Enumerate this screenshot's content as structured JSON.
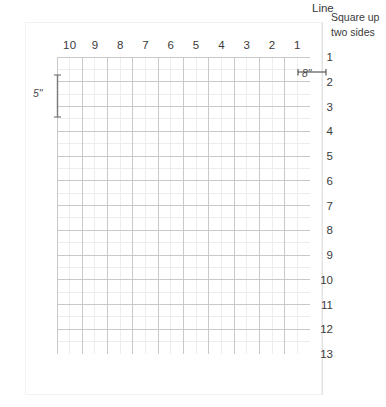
{
  "diagram": {
    "note_lines": [
      "Square up",
      "two sides"
    ],
    "column_headers": [
      "10",
      "9",
      "8",
      "7",
      "6",
      "5",
      "4",
      "3",
      "2",
      "1"
    ],
    "column_axis_label": "Line",
    "row_labels": [
      "1",
      "2",
      "3",
      "4",
      "5",
      "6",
      "7",
      "8",
      "9",
      "10",
      "11",
      "12",
      "13"
    ],
    "dimensions": {
      "vertical": {
        "label": "5\"",
        "spans_rows": "1 to 2"
      },
      "horizontal": {
        "label": "8\"",
        "spans_columns": "1",
        "top_label": "1"
      }
    },
    "colors": {
      "grid_major": "#c9c9c9",
      "grid_minor": "#ededed",
      "text": "#3a3a3a",
      "divider": "#e2e2e2",
      "page_border": "#f2f2f2",
      "background": "#ffffff"
    },
    "grid": {
      "columns": 10,
      "rows": 12,
      "minor_per_cell": 1,
      "cell_width_px": 25.3,
      "cell_height_px": 24.75
    }
  }
}
